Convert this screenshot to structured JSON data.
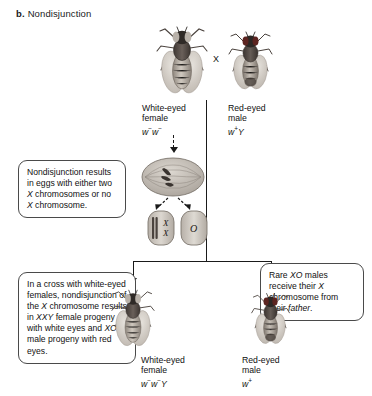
{
  "figure": {
    "panel_letter": "b.",
    "panel_title": "Nondisjunction",
    "cross_symbol": "X"
  },
  "parents": [
    {
      "id": "white-eyed-female",
      "name": "White-eyed\nfemale",
      "genotype_html": "w<sup>−</sup>w<sup>−</sup>",
      "sex": "female",
      "eye_color": "white",
      "fly_art": "drosophila-female-white-eyed"
    },
    {
      "id": "red-eyed-male",
      "name": "Red-eyed\nmale",
      "genotype_html": "w<sup>+</sup>Y",
      "sex": "male",
      "eye_color": "red",
      "fly_art": "drosophila-male-red-eyed"
    }
  ],
  "meiosis": {
    "cell_label": "dividing-oocyte",
    "eggs": [
      {
        "id": "egg-xx",
        "label": "X X",
        "description": "egg with two X chromosomes"
      },
      {
        "id": "egg-o",
        "label": "O",
        "description": "egg with no X chromosome"
      }
    ]
  },
  "callouts": [
    {
      "id": "nondisjunction-note",
      "text_html": "Nondisjunction results in eggs with either two <i>X</i> chromosomes or no <i>X</i> chromosome."
    },
    {
      "id": "cross-outcome-note",
      "text_html": "In a cross with white-eyed females, nondisjunction of the <i>X</i> chromosome results in <i>XXY</i> female progeny with white eyes and <i>XO</i> male progeny with red eyes."
    },
    {
      "id": "xo-male-note",
      "text_html": "Rare <i>XO</i> males receive their <i>X</i> chromosome from their <i>father</i>."
    }
  ],
  "progeny": [
    {
      "id": "progeny-white-eyed-female",
      "name": "White-eyed\nfemale",
      "genotype_html": "w<sup>−</sup>w<sup>−</sup>Y",
      "sex": "female",
      "eye_color": "white",
      "fly_art": "drosophila-female-white-eyed"
    },
    {
      "id": "progeny-red-eyed-male",
      "name": "Red-eyed\nmale",
      "genotype_html": "w<sup>+</sup>",
      "sex": "male",
      "eye_color": "red",
      "fly_art": "drosophila-male-red-eyed"
    }
  ],
  "colors": {
    "line": "#1a1a1a",
    "callout_border": "#4a4a4a",
    "text": "#111111",
    "background": "#ffffff",
    "fly_body_dark": "#3a3330",
    "fly_wing": "#cfc9c2"
  }
}
